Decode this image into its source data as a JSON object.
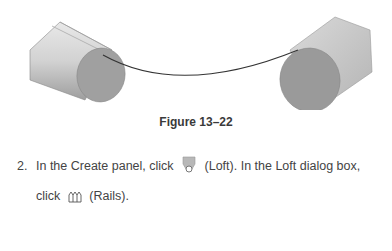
{
  "figure": {
    "caption": "Figure 13–22",
    "colors": {
      "body": "#c8c8c8",
      "face": "#9a9a9a",
      "rail": "#333333"
    }
  },
  "step": {
    "number": "2.",
    "line1_pre": "In the Create panel, click",
    "loft_icon": "loft-icon",
    "line1_post": "(Loft). In the Loft dialog box,",
    "line2_pre": "click",
    "rails_icon": "rails-icon",
    "line2_post": "(Rails)."
  }
}
